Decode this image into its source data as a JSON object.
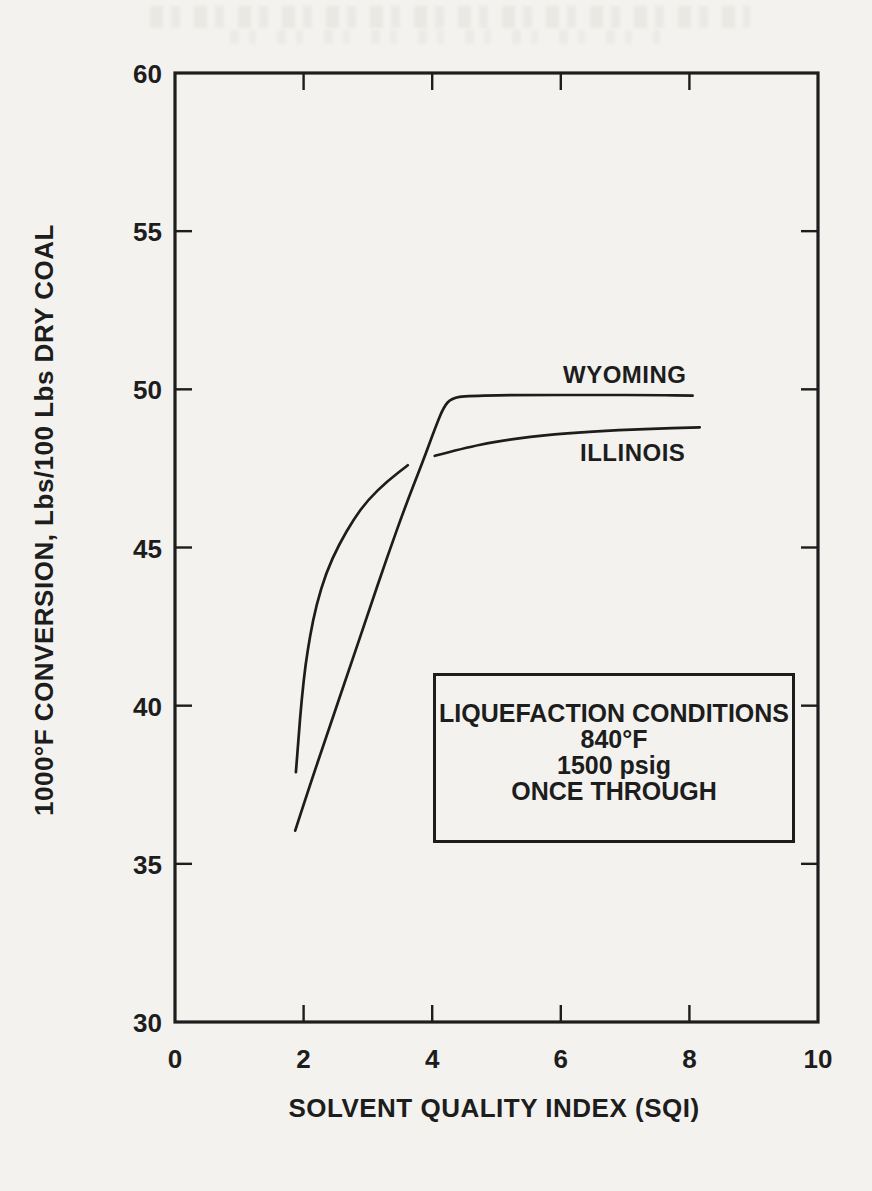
{
  "colors": {
    "ink": "#1d1d1d",
    "paper": "#f3f2ee"
  },
  "chart_data": {
    "type": "line",
    "title": "",
    "xlabel": "SOLVENT QUALITY INDEX (SQI)",
    "ylabel": "1000°F CONVERSION, Lbs/100 Lbs DRY COAL",
    "xlim": [
      0,
      10
    ],
    "ylim": [
      30,
      60
    ],
    "grid": false,
    "frame": "full-box",
    "x_tick_labels": [
      0,
      2,
      4,
      6,
      8,
      10
    ],
    "y_tick_labels": [
      30,
      35,
      40,
      45,
      50,
      55,
      60
    ],
    "x_tick_marks": [
      2,
      4,
      6,
      8
    ],
    "y_tick_marks": [
      35,
      40,
      45,
      50,
      55
    ],
    "ticks_on_all_sides": true,
    "legend_position": "labels-near-curves",
    "series": [
      {
        "name": "WYOMING",
        "segments": [
          [
            [
              1.87,
              36.05
            ],
            [
              2.1,
              37.5
            ],
            [
              2.4,
              39.3
            ],
            [
              2.7,
              41.1
            ],
            [
              3.0,
              42.9
            ],
            [
              3.3,
              44.7
            ],
            [
              3.6,
              46.4
            ],
            [
              3.85,
              47.7
            ],
            [
              4.05,
              48.8
            ],
            [
              4.18,
              49.45
            ],
            [
              4.3,
              49.72
            ],
            [
              4.55,
              49.8
            ],
            [
              5.5,
              49.82
            ],
            [
              6.5,
              49.82
            ],
            [
              7.5,
              49.82
            ],
            [
              8.05,
              49.8
            ]
          ]
        ]
      },
      {
        "name": "ILLINOIS",
        "segments": [
          [
            [
              1.88,
              37.9
            ],
            [
              1.92,
              39.0
            ],
            [
              1.97,
              40.2
            ],
            [
              2.03,
              41.3
            ],
            [
              2.1,
              42.2
            ],
            [
              2.2,
              43.2
            ],
            [
              2.35,
              44.2
            ],
            [
              2.55,
              45.1
            ],
            [
              2.78,
              45.9
            ],
            [
              3.0,
              46.5
            ],
            [
              3.3,
              47.1
            ],
            [
              3.62,
              47.6
            ]
          ],
          [
            [
              4.04,
              47.9
            ],
            [
              4.5,
              48.15
            ],
            [
              5.0,
              48.35
            ],
            [
              5.7,
              48.55
            ],
            [
              6.5,
              48.67
            ],
            [
              7.3,
              48.75
            ],
            [
              8.16,
              48.8
            ]
          ]
        ]
      }
    ],
    "annotation": {
      "lines": [
        "LIQUEFACTION CONDITIONS",
        "840°F",
        "1500 psig",
        "ONCE THROUGH"
      ]
    }
  }
}
